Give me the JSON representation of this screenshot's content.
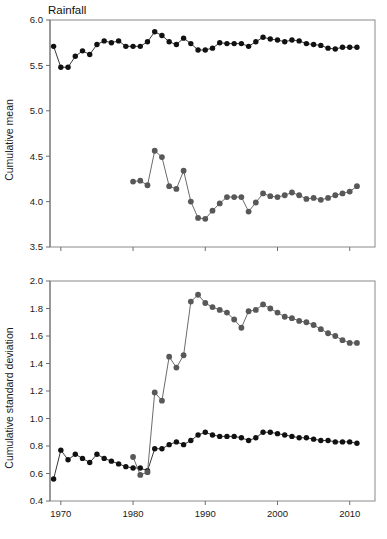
{
  "figure": {
    "title": "Rainfall",
    "background": "#ffffff",
    "colors": {
      "series_black": "#111111",
      "series_gray": "#585858",
      "axis": "#6e6e6e",
      "frame": "#8a8a8a",
      "text": "#1a1a1a"
    }
  },
  "chart_data": [
    {
      "type": "line",
      "title": "Rainfall",
      "xlabel": "",
      "ylabel": "Cumulative mean",
      "xlim": [
        1968.5,
        2013.5
      ],
      "ylim": [
        3.5,
        6.0
      ],
      "xticks": [
        1970,
        1980,
        1990,
        2000,
        2010
      ],
      "yticks": [
        3.5,
        4.0,
        4.5,
        5.0,
        5.5,
        6.0
      ],
      "grid": false,
      "legend": "none",
      "series": [
        {
          "name": "Series A (black)",
          "color": "#111111",
          "marker": "circle",
          "x": [
            1969,
            1970,
            1971,
            1972,
            1973,
            1974,
            1975,
            1976,
            1977,
            1978,
            1979,
            1980,
            1981,
            1982,
            1983,
            1984,
            1985,
            1986,
            1987,
            1988,
            1989,
            1990,
            1991,
            1992,
            1993,
            1994,
            1995,
            1996,
            1997,
            1998,
            1999,
            2000,
            2001,
            2002,
            2003,
            2004,
            2005,
            2006,
            2007,
            2008,
            2009,
            2010,
            2011
          ],
          "values": [
            5.71,
            5.48,
            5.48,
            5.6,
            5.66,
            5.62,
            5.73,
            5.77,
            5.75,
            5.77,
            5.71,
            5.71,
            5.71,
            5.76,
            5.87,
            5.83,
            5.76,
            5.73,
            5.8,
            5.74,
            5.67,
            5.67,
            5.69,
            5.75,
            5.74,
            5.74,
            5.74,
            5.71,
            5.76,
            5.81,
            5.79,
            5.78,
            5.76,
            5.78,
            5.77,
            5.74,
            5.73,
            5.72,
            5.69,
            5.68,
            5.7,
            5.7,
            5.7
          ]
        },
        {
          "name": "Series B (gray)",
          "color": "#585858",
          "marker": "circle",
          "x": [
            1980,
            1981,
            1982,
            1983,
            1984,
            1985,
            1986,
            1987,
            1988,
            1989,
            1990,
            1991,
            1992,
            1993,
            1994,
            1995,
            1996,
            1997,
            1998,
            1999,
            2000,
            2001,
            2002,
            2003,
            2004,
            2005,
            2006,
            2007,
            2008,
            2009,
            2010,
            2011
          ],
          "values": [
            4.22,
            4.23,
            4.18,
            4.56,
            4.49,
            4.17,
            4.14,
            4.34,
            4.0,
            3.82,
            3.81,
            3.9,
            3.98,
            4.05,
            4.05,
            4.05,
            3.89,
            3.99,
            4.09,
            4.06,
            4.05,
            4.07,
            4.1,
            4.07,
            4.03,
            4.04,
            4.02,
            4.04,
            4.07,
            4.09,
            4.11,
            4.17
          ]
        }
      ]
    },
    {
      "type": "line",
      "title": "",
      "xlabel": "",
      "ylabel": "Cumulative standard deviation",
      "xlim": [
        1968.5,
        2013.5
      ],
      "ylim": [
        0.4,
        2.0
      ],
      "xticks": [
        1970,
        1980,
        1990,
        2000,
        2010
      ],
      "yticks": [
        0.4,
        0.6,
        0.8,
        1.0,
        1.2,
        1.4,
        1.6,
        1.8,
        2.0
      ],
      "grid": false,
      "legend": "none",
      "series": [
        {
          "name": "Series A (black)",
          "color": "#111111",
          "marker": "circle",
          "x": [
            1969,
            1970,
            1971,
            1972,
            1973,
            1974,
            1975,
            1976,
            1977,
            1978,
            1979,
            1980,
            1981,
            1982,
            1983,
            1984,
            1985,
            1986,
            1987,
            1988,
            1989,
            1990,
            1991,
            1992,
            1993,
            1994,
            1995,
            1996,
            1997,
            1998,
            1999,
            2000,
            2001,
            2002,
            2003,
            2004,
            2005,
            2006,
            2007,
            2008,
            2009,
            2010,
            2011
          ],
          "values": [
            0.56,
            0.77,
            0.7,
            0.74,
            0.71,
            0.68,
            0.74,
            0.71,
            0.69,
            0.67,
            0.65,
            0.64,
            0.64,
            0.62,
            0.78,
            0.78,
            0.81,
            0.83,
            0.81,
            0.84,
            0.88,
            0.9,
            0.88,
            0.87,
            0.87,
            0.87,
            0.86,
            0.84,
            0.86,
            0.9,
            0.9,
            0.89,
            0.88,
            0.87,
            0.86,
            0.86,
            0.85,
            0.84,
            0.84,
            0.83,
            0.83,
            0.83,
            0.82
          ]
        },
        {
          "name": "Series B (gray)",
          "color": "#585858",
          "marker": "circle",
          "x": [
            1980,
            1981,
            1982,
            1983,
            1984,
            1985,
            1986,
            1987,
            1988,
            1989,
            1990,
            1991,
            1992,
            1993,
            1994,
            1995,
            1996,
            1997,
            1998,
            1999,
            2000,
            2001,
            2002,
            2003,
            2004,
            2005,
            2006,
            2007,
            2008,
            2009,
            2010,
            2011
          ],
          "values": [
            0.72,
            0.59,
            0.61,
            1.19,
            1.13,
            1.45,
            1.37,
            1.46,
            1.85,
            1.9,
            1.84,
            1.81,
            1.79,
            1.77,
            1.72,
            1.66,
            1.78,
            1.79,
            1.83,
            1.8,
            1.77,
            1.74,
            1.73,
            1.71,
            1.7,
            1.68,
            1.65,
            1.62,
            1.6,
            1.57,
            1.55,
            1.55
          ]
        }
      ]
    }
  ],
  "panels": {
    "top": {
      "title": "Rainfall",
      "ylabel": "Cumulative mean",
      "ytick_labels": [
        "6.0",
        "5.5",
        "5.0",
        "4.5",
        "4.0",
        "3.5"
      ]
    },
    "bottom": {
      "ylabel": "Cumulative standard deviation",
      "ytick_labels": [
        "2.0",
        "1.8",
        "1.6",
        "1.4",
        "1.2",
        "1.0",
        "0.8",
        "0.6",
        "0.4"
      ],
      "xtick_labels": [
        "1970",
        "1980",
        "1990",
        "2000",
        "2010"
      ]
    }
  }
}
